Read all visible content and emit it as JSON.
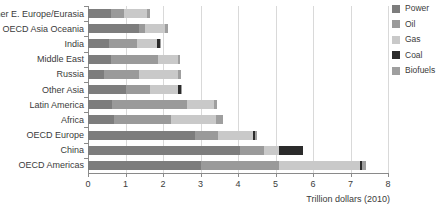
{
  "chart_data": {
    "type": "bar",
    "orientation": "horizontal",
    "stacked": true,
    "title": "",
    "xlabel": "Trillion dollars (2010)",
    "ylabel": "",
    "xlim": [
      0,
      8
    ],
    "xticks": [
      0,
      1,
      2,
      3,
      4,
      5,
      6,
      7,
      8
    ],
    "xticklabels": [
      "0",
      "1",
      "2",
      "3",
      "4",
      "5",
      "6",
      "7",
      "8"
    ],
    "grid": "vertical",
    "legend_position": "right",
    "categories": [
      "Other E. Europe/Eurasia",
      "OECD Asia Oceania",
      "India",
      "Middle East",
      "Russia",
      "Other Asia",
      "Latin America",
      "Africa",
      "OECD Europe",
      "China",
      "OECD Americas"
    ],
    "series": [
      {
        "name": "Power",
        "color": "#7d7d7d",
        "values": [
          0.62,
          1.35,
          0.55,
          0.62,
          0.42,
          1.0,
          0.65,
          0.7,
          2.85,
          4.05,
          3.0
        ]
      },
      {
        "name": "Oil",
        "color": "#9a9a9a",
        "values": [
          0.33,
          0.18,
          0.75,
          1.25,
          0.93,
          0.65,
          2.0,
          1.5,
          0.62,
          0.65,
          2.1
        ]
      },
      {
        "name": "Gas",
        "color": "#c9c9c9",
        "values": [
          0.63,
          0.52,
          0.55,
          0.52,
          1.05,
          0.75,
          0.72,
          1.2,
          0.93,
          0.4,
          2.15
        ]
      },
      {
        "name": "Coal",
        "color": "#2b2b2b",
        "values": [
          0.0,
          0.0,
          0.07,
          0.0,
          0.0,
          0.08,
          0.0,
          0.0,
          0.05,
          0.63,
          0.06
        ]
      },
      {
        "name": "Biofuels",
        "color": "#9f9f9f",
        "values": [
          0.07,
          0.07,
          0.03,
          0.06,
          0.07,
          0.02,
          0.08,
          0.2,
          0.05,
          0.0,
          0.09
        ]
      }
    ],
    "totals": [
      1.65,
      2.12,
      1.95,
      2.45,
      2.47,
      2.5,
      3.45,
      3.6,
      4.5,
      5.73,
      7.4
    ]
  },
  "legend": {
    "items": [
      {
        "label": "Power",
        "color": "#7d7d7d"
      },
      {
        "label": "Oil",
        "color": "#9a9a9a"
      },
      {
        "label": "Gas",
        "color": "#c9c9c9"
      },
      {
        "label": "Coal",
        "color": "#2b2b2b"
      },
      {
        "label": "Biofuels",
        "color": "#9f9f9f"
      }
    ]
  },
  "axis": {
    "x_title": "Trillion dollars (2010)"
  }
}
